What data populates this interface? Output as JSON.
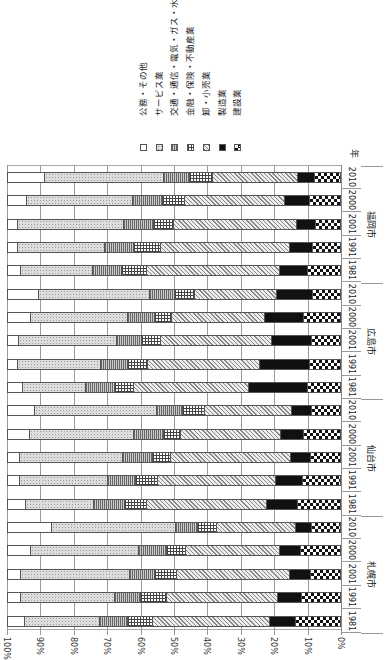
{
  "chart_data": {
    "type": "bar",
    "orientation": "horizontal-stacked-100pct (figure rotated 90deg)",
    "title": "",
    "xlabel": "",
    "ylabel": "年",
    "xlim": [
      0,
      100
    ],
    "x_ticks": [
      "100%",
      "90%",
      "80%",
      "70%",
      "60%",
      "50%",
      "40%",
      "30%",
      "20%",
      "10%",
      "0%"
    ],
    "grid": true,
    "legend_position": "top (rotated)",
    "legend": [
      {
        "key": "public",
        "label": "公務・その他",
        "pattern": "white"
      },
      {
        "key": "service",
        "label": "サービス業",
        "pattern": "dotted"
      },
      {
        "key": "transport",
        "label": "交通・通信・電気・ガス・水道",
        "pattern": "vertical-stripes"
      },
      {
        "key": "finance",
        "label": "金融・保険・不動産業",
        "pattern": "grid"
      },
      {
        "key": "retail",
        "label": "卸・小売業",
        "pattern": "diagonal"
      },
      {
        "key": "manuf",
        "label": "製造業",
        "pattern": "solid-black"
      },
      {
        "key": "constr",
        "label": "建設業",
        "pattern": "checker"
      }
    ],
    "groups": [
      {
        "city": "札幌市",
        "bars": [
          {
            "year": "1981",
            "constr": 13.5,
            "manuf": 7.8,
            "retail": 35.3,
            "finance": 7.5,
            "transport": 8.5,
            "service": 22.7,
            "public": 4.7
          },
          {
            "year": "1991",
            "constr": 11.7,
            "manuf": 7.2,
            "retail": 33.5,
            "finance": 7.8,
            "transport": 7.8,
            "service": 28.4,
            "public": 3.6
          },
          {
            "year": "2001",
            "constr": 9.0,
            "manuf": 6.3,
            "retail": 34.1,
            "finance": 6.6,
            "transport": 7.5,
            "service": 32.9,
            "public": 3.6
          },
          {
            "year": "2000",
            "constr": 12.0,
            "manuf": 6.3,
            "retail": 28.4,
            "finance": 5.7,
            "transport": 8.4,
            "service": 32.6,
            "public": 6.6
          },
          {
            "year": "2010",
            "constr": 8.7,
            "manuf": 4.8,
            "retail": 23.7,
            "finance": 6.0,
            "transport": 6.6,
            "service": 37.1,
            "public": 13.1
          }
        ]
      },
      {
        "city": "仙台市",
        "bars": [
          {
            "year": "1981",
            "constr": 12.9,
            "manuf": 9.3,
            "retail": 36.2,
            "finance": 6.6,
            "transport": 9.3,
            "service": 20.7,
            "public": 5.0
          },
          {
            "year": "1991",
            "constr": 11.4,
            "manuf": 8.1,
            "retail": 35.6,
            "finance": 6.6,
            "transport": 8.4,
            "service": 26.6,
            "public": 3.3
          },
          {
            "year": "2001",
            "constr": 9.0,
            "manuf": 6.0,
            "retail": 36.2,
            "finance": 5.4,
            "transport": 9.0,
            "service": 31.1,
            "public": 3.3
          },
          {
            "year": "2000",
            "constr": 11.1,
            "manuf": 6.9,
            "retail": 30.2,
            "finance": 5.1,
            "transport": 9.0,
            "service": 31.4,
            "public": 6.3
          },
          {
            "year": "2010",
            "constr": 8.7,
            "manuf": 6.0,
            "retail": 26.3,
            "finance": 6.6,
            "transport": 7.8,
            "service": 36.8,
            "public": 7.8
          }
        ]
      },
      {
        "city": "広島市",
        "bars": [
          {
            "year": "1981",
            "constr": 9.9,
            "manuf": 17.7,
            "retail": 34.7,
            "finance": 5.7,
            "transport": 8.7,
            "service": 19.2,
            "public": 4.1
          },
          {
            "year": "1991",
            "constr": 9.3,
            "manuf": 15.0,
            "retail": 33.8,
            "finance": 6.0,
            "transport": 8.1,
            "service": 25.1,
            "public": 2.7
          },
          {
            "year": "2001",
            "constr": 8.7,
            "manuf": 12.0,
            "retail": 33.5,
            "finance": 5.7,
            "transport": 7.5,
            "service": 29.6,
            "public": 3.0
          },
          {
            "year": "2000",
            "constr": 11.1,
            "manuf": 11.7,
            "retail": 28.1,
            "finance": 5.1,
            "transport": 8.1,
            "service": 29.3,
            "public": 6.6
          },
          {
            "year": "2010",
            "constr": 8.4,
            "manuf": 10.8,
            "retail": 24.9,
            "finance": 6.0,
            "transport": 7.5,
            "service": 33.5,
            "public": 8.9
          }
        ]
      },
      {
        "city": "福岡市",
        "bars": [
          {
            "year": "1981",
            "constr": 9.9,
            "manuf": 8.4,
            "retail": 40.1,
            "finance": 7.5,
            "transport": 8.7,
            "service": 21.9,
            "public": 3.5
          },
          {
            "year": "1991",
            "constr": 8.4,
            "manuf": 6.9,
            "retail": 38.9,
            "finance": 8.1,
            "transport": 8.7,
            "service": 26.3,
            "public": 2.7
          },
          {
            "year": "2001",
            "constr": 7.5,
            "manuf": 5.7,
            "retail": 37.1,
            "finance": 6.0,
            "transport": 9.0,
            "service": 32.0,
            "public": 2.7
          },
          {
            "year": "2000",
            "constr": 9.3,
            "manuf": 7.5,
            "retail": 30.2,
            "finance": 6.6,
            "transport": 9.0,
            "service": 32.0,
            "public": 5.4
          },
          {
            "year": "2010",
            "constr": 7.8,
            "manuf": 5.1,
            "retail": 25.7,
            "finance": 6.9,
            "transport": 7.8,
            "service": 36.0,
            "public": 10.7
          }
        ]
      }
    ]
  },
  "axis": {
    "year_header": "年"
  }
}
